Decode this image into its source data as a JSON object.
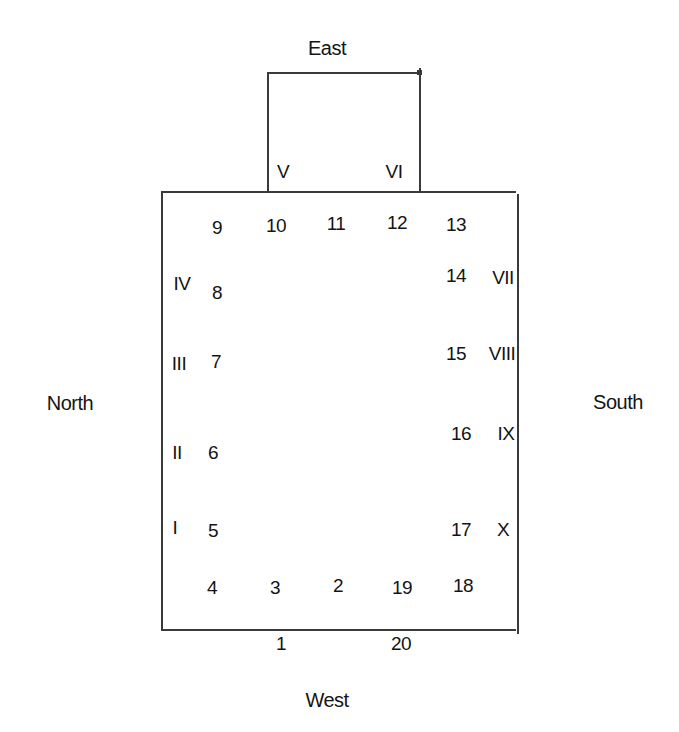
{
  "diagram": {
    "type": "seating-arrangement-floor-plan",
    "directions": {
      "top": "East",
      "bottom": "West",
      "left": "North",
      "right": "South"
    },
    "annex_labels": {
      "left": "V",
      "right": "VI"
    },
    "left_side": {
      "roman": [
        "IV",
        "III",
        "II",
        "I"
      ],
      "numbers": [
        "9",
        "8",
        "7",
        "6",
        "5",
        "4"
      ]
    },
    "top_side": {
      "numbers": [
        "10",
        "11",
        "12",
        "13"
      ]
    },
    "right_side": {
      "numbers": [
        "14",
        "15",
        "16",
        "17",
        "18"
      ],
      "roman": [
        "VII",
        "VIII",
        "IX",
        "X"
      ]
    },
    "bottom_side": {
      "inner_numbers": [
        "3",
        "2",
        "19"
      ],
      "outer_numbers": [
        "1",
        "20"
      ]
    },
    "positions": {
      "n1": "1",
      "n2": "2",
      "n3": "3",
      "n4": "4",
      "n5": "5",
      "n6": "6",
      "n7": "7",
      "n8": "8",
      "n9": "9",
      "n10": "10",
      "n11": "11",
      "n12": "12",
      "n13": "13",
      "n14": "14",
      "n15": "15",
      "n16": "16",
      "n17": "17",
      "n18": "18",
      "n19": "19",
      "n20": "20",
      "rI": "I",
      "rII": "II",
      "rIII": "III",
      "rIV": "IV",
      "rV": "V",
      "rVI": "VI",
      "rVII": "VII",
      "rVIII": "VIII",
      "rIX": "IX",
      "rX": "X"
    }
  }
}
